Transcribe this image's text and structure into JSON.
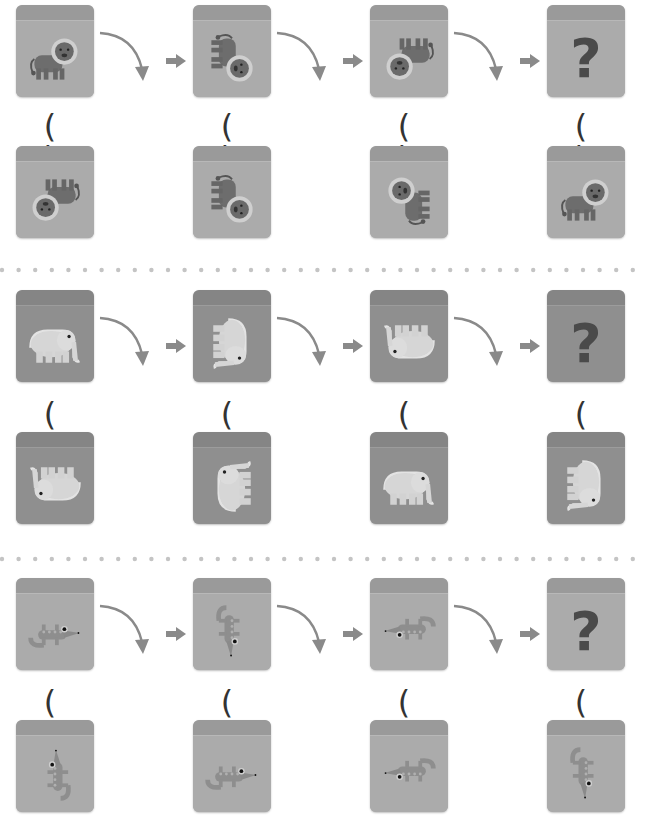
{
  "rows": [
    {
      "animal": "lion",
      "sequence": [
        {
          "content": "lion",
          "orientation": "upright",
          "rotation": 0
        },
        {
          "content": "lion",
          "orientation": "rotated-90",
          "rotation": 90
        },
        {
          "content": "lion",
          "orientation": "upside-down",
          "rotation": 180
        },
        {
          "content": "?",
          "orientation": "unknown"
        }
      ],
      "options": [
        {
          "label": "( )",
          "content": "lion",
          "orientation": "upside-down",
          "rotation": 180
        },
        {
          "label": "( )",
          "content": "lion",
          "orientation": "rotated-90",
          "rotation": 90
        },
        {
          "label": "( )",
          "content": "lion",
          "orientation": "rotated-270",
          "rotation": 270
        },
        {
          "label": "( )",
          "content": "lion",
          "orientation": "upright",
          "rotation": 0
        }
      ]
    },
    {
      "animal": "elephant",
      "sequence": [
        {
          "content": "elephant",
          "orientation": "upright",
          "rotation": 0
        },
        {
          "content": "elephant",
          "orientation": "rotated-90",
          "rotation": 90
        },
        {
          "content": "elephant",
          "orientation": "upside-down",
          "rotation": 180
        },
        {
          "content": "?",
          "orientation": "unknown"
        }
      ],
      "options": [
        {
          "label": "( )",
          "content": "elephant",
          "orientation": "upside-down",
          "rotation": 180
        },
        {
          "label": "( )",
          "content": "elephant",
          "orientation": "rotated-270",
          "rotation": 270
        },
        {
          "label": "( )",
          "content": "elephant",
          "orientation": "upright",
          "rotation": 0
        },
        {
          "label": "( )",
          "content": "elephant",
          "orientation": "rotated-90",
          "rotation": 90
        }
      ]
    },
    {
      "animal": "crocodile",
      "sequence": [
        {
          "content": "crocodile",
          "orientation": "upright",
          "rotation": 0
        },
        {
          "content": "crocodile",
          "orientation": "rotated-90",
          "rotation": 90
        },
        {
          "content": "crocodile",
          "orientation": "upside-down",
          "rotation": 180
        },
        {
          "content": "?",
          "orientation": "unknown"
        }
      ],
      "options": [
        {
          "label": "( )",
          "content": "crocodile",
          "orientation": "rotated-270",
          "rotation": 270
        },
        {
          "label": "( )",
          "content": "crocodile",
          "orientation": "upright",
          "rotation": 0
        },
        {
          "label": "( )",
          "content": "crocodile",
          "orientation": "upside-down",
          "rotation": 180
        },
        {
          "label": "( )",
          "content": "crocodile",
          "orientation": "rotated-90",
          "rotation": 90
        }
      ]
    }
  ],
  "question_mark": "?",
  "colors": {
    "cube_face": "#ababab",
    "cube_top": "#9a9a9a",
    "arrow": "#8a8a8a",
    "question_mark": "#4a4a4a",
    "paren": "#333333",
    "divider_dot": "#c4c4c4"
  }
}
